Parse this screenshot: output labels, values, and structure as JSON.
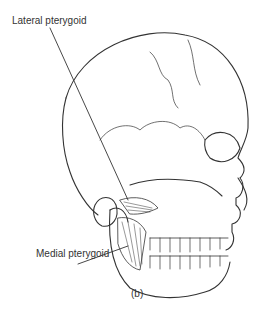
{
  "figure": {
    "labels": {
      "lateral": "Lateral pterygoid",
      "medial": "Medial pterygoid"
    },
    "panel": "(b)"
  }
}
